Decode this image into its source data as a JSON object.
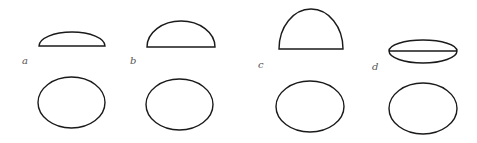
{
  "diagram": {
    "stroke_color": "#1a1a1a",
    "label_color": "#555555",
    "panels": [
      {
        "label": "a",
        "label_pos": [
          22,
          64
        ],
        "top_shape": {
          "type": "cap",
          "x1": 39,
          "x2": 105,
          "base_y": 46,
          "top_y": 32
        },
        "bottom_ellipse": {
          "cx": 71.5,
          "cy": 102.5,
          "rx": 33.5,
          "ry": 25.5
        }
      },
      {
        "label": "b",
        "label_pos": [
          130,
          64
        ],
        "top_shape": {
          "type": "cap",
          "x1": 147,
          "x2": 215,
          "base_y": 47,
          "top_y": 21
        },
        "bottom_ellipse": {
          "cx": 179.5,
          "cy": 104.5,
          "rx": 33.5,
          "ry": 25.5
        }
      },
      {
        "label": "c",
        "label_pos": [
          258,
          68
        ],
        "top_shape": {
          "type": "cap",
          "x1": 279,
          "x2": 343,
          "base_y": 49,
          "top_y": 9
        },
        "bottom_ellipse": {
          "cx": 310,
          "cy": 106.5,
          "rx": 34,
          "ry": 25.5
        }
      },
      {
        "label": "d",
        "label_pos": [
          372,
          70
        ],
        "top_shape": {
          "type": "lens",
          "x1": 389,
          "x2": 457,
          "mid_y": 51,
          "top_y": 40,
          "bottom_y": 63
        },
        "bottom_ellipse": {
          "cx": 423,
          "cy": 108.5,
          "rx": 34,
          "ry": 25.5
        }
      }
    ]
  }
}
